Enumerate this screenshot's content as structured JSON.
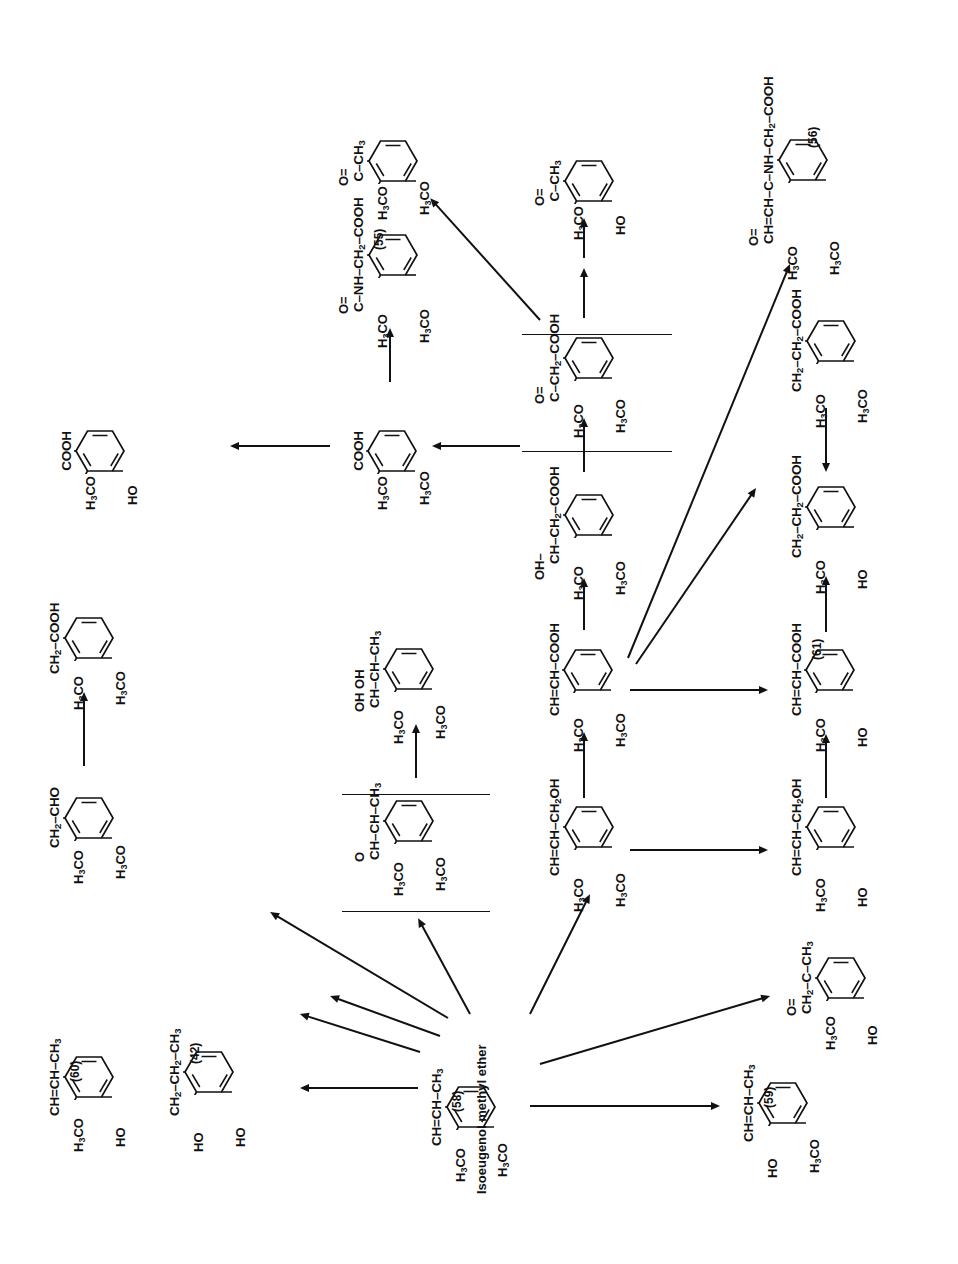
{
  "figure": {
    "start_material_name": "Isoeugenol methyl ether",
    "start_material_tag": "(58)"
  },
  "labels": {
    "h3co": "H<sub>3</sub>CO",
    "ho": "HO",
    "oh": "OH"
  },
  "molecules": {
    "m58": {
      "chain": "CH=CH&ndash;CH<sub>3</sub>",
      "left_top": "H<sub>3</sub>CO",
      "left_bottom": "H<sub>3</sub>CO",
      "tag": "(58)",
      "name": "Isoeugenol methyl ether"
    },
    "m60": {
      "chain": "CH=CH&ndash;CH<sub>3</sub>",
      "left_top": "H<sub>3</sub>CO",
      "left_bottom": "HO",
      "tag": "(60)",
      "name": ""
    },
    "m42": {
      "chain": "CH<sub>2</sub>&ndash;CH<sub>2</sub>&ndash;CH<sub>3</sub>",
      "left_top": "HO",
      "left_bottom": "HO",
      "tag": "(42)",
      "name": ""
    },
    "m59": {
      "chain": "CH=CH&ndash;CH<sub>3</sub>",
      "left_top": "HO",
      "left_bottom": "H<sub>3</sub>CO",
      "tag": "(59)",
      "name": ""
    },
    "epoxide": {
      "chain": "CH&ndash;CH&ndash;CH<sub>3</sub>",
      "pendant": "O",
      "left_top": "H<sub>3</sub>CO",
      "left_bottom": "H<sub>3</sub>CO",
      "tag": "",
      "name": "",
      "bracketed": "yes"
    },
    "diol": {
      "chain": "CH&ndash;CH&ndash;CH<sub>3</sub>",
      "pendant": "OH  OH",
      "left_top": "H<sub>3</sub>CO",
      "left_bottom": "H<sub>3</sub>CO",
      "tag": "",
      "name": ""
    },
    "phenylacetaldehyde": {
      "chain": "CH<sub>2</sub>&ndash;CHO",
      "left_top": "H<sub>3</sub>CO",
      "left_bottom": "H<sub>3</sub>CO",
      "tag": "",
      "name": ""
    },
    "phenylacetic_acid": {
      "chain": "CH<sub>2</sub>&ndash;COOH",
      "left_top": "H<sub>3</sub>CO",
      "left_bottom": "H<sub>3</sub>CO",
      "tag": "",
      "name": ""
    },
    "vanillic_acid": {
      "chain": "COOH",
      "left_top": "H<sub>3</sub>CO",
      "left_bottom": "HO",
      "tag": "",
      "name": ""
    },
    "veratric_acid": {
      "chain": "COOH",
      "left_top": "H<sub>3</sub>CO",
      "left_bottom": "H<sub>3</sub>CO",
      "tag": "",
      "name": ""
    },
    "m55": {
      "chain": "C&ndash;NH&ndash;CH<sub>2</sub>&ndash;COOH",
      "pendant": "O=",
      "left_top": "H<sub>3</sub>CO",
      "left_bottom": "H<sub>3</sub>CO",
      "tag": "(55)",
      "name": ""
    },
    "cinnamyl_alcohol": {
      "chain": "CH=CH&ndash;CH<sub>2</sub>OH",
      "left_top": "H<sub>3</sub>CO",
      "left_bottom": "H<sub>3</sub>CO",
      "tag": "",
      "name": ""
    },
    "dimethoxycinnamic_acid": {
      "chain": "CH=CH&ndash;COOH",
      "left_top": "H<sub>3</sub>CO",
      "left_bottom": "H<sub>3</sub>CO",
      "tag": "",
      "name": ""
    },
    "hydroxy_acid": {
      "chain": "CH&ndash;CH<sub>2</sub>&ndash;COOH",
      "pendant": "OH&ndash;",
      "left_top": "H<sub>3</sub>CO",
      "left_bottom": "H<sub>3</sub>CO",
      "tag": "",
      "name": ""
    },
    "keto_acid": {
      "chain": "C&ndash;CH<sub>2</sub>&ndash;COOH",
      "pendant": "O=",
      "left_top": "H<sub>3</sub>CO",
      "left_bottom": "H<sub>3</sub>CO",
      "tag": "",
      "name": "",
      "bracketed": "yes"
    },
    "acetovanillone": {
      "chain": "C&ndash;CH<sub>3</sub>",
      "pendant": "O=",
      "left_top": "H<sub>3</sub>CO",
      "left_bottom": "HO",
      "tag": "",
      "name": ""
    },
    "acetoveratrone": {
      "chain": "C&ndash;CH<sub>3</sub>",
      "pendant": "O=",
      "left_top": "H<sub>3</sub>CO",
      "left_bottom": "H<sub>3</sub>CO",
      "tag": "",
      "name": ""
    },
    "hydroxy_ketone": {
      "chain": "CH<sub>2</sub>&ndash;C&ndash;CH<sub>3</sub>",
      "pendant": "O=",
      "left_top": "H<sub>3</sub>CO",
      "left_bottom": "HO",
      "tag": "",
      "name": ""
    },
    "coniferyl_alcohol": {
      "chain": "CH=CH&ndash;CH<sub>2</sub>OH",
      "left_top": "H<sub>3</sub>CO",
      "left_bottom": "HO",
      "tag": "",
      "name": ""
    },
    "m61": {
      "chain": "CH=CH&ndash;COOH",
      "left_top": "H<sub>3</sub>CO",
      "left_bottom": "HO",
      "tag": "(61)",
      "name": ""
    },
    "dihydroferulic_acid": {
      "chain": "CH<sub>2</sub>&ndash;CH<sub>2</sub>&ndash;COOH",
      "left_top": "H<sub>3</sub>CO",
      "left_bottom": "HO",
      "tag": "",
      "name": ""
    },
    "dihydro_dimethoxy_acid": {
      "chain": "CH<sub>2</sub>&ndash;CH<sub>2</sub>&ndash;COOH",
      "left_top": "H<sub>3</sub>CO",
      "left_bottom": "H<sub>3</sub>CO",
      "tag": "",
      "name": ""
    },
    "m56": {
      "chain": "CH=CH&ndash;C&ndash;NH&ndash;CH<sub>2</sub>&ndash;COOH",
      "pendant": "O=",
      "left_top": "H<sub>3</sub>CO",
      "left_bottom": "H<sub>3</sub>CO",
      "tag": "(56)",
      "name": ""
    }
  },
  "colors": {
    "ink": "#111111",
    "background": "#ffffff"
  }
}
